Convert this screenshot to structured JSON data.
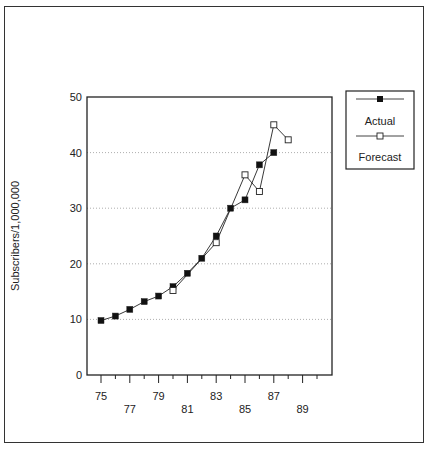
{
  "chart_data": {
    "type": "line",
    "title": "",
    "xlabel": "",
    "ylabel": "Subscribers/1,000,000",
    "ylim": [
      0,
      50
    ],
    "yticks": [
      0,
      10,
      20,
      30,
      40,
      50
    ],
    "xlim": [
      75,
      90
    ],
    "xtick_labels": [
      "75",
      "77",
      "79",
      "81",
      "83",
      "85",
      "87",
      "89"
    ],
    "grid": "horizontal dotted",
    "legend_position": "right",
    "series": [
      {
        "name": "Actual",
        "marker": "filled-square",
        "x": [
          75,
          76,
          77,
          78,
          79,
          80,
          81,
          82,
          83,
          84,
          85,
          86,
          87
        ],
        "values": [
          9.8,
          10.6,
          11.8,
          13.2,
          14.2,
          15.9,
          18.3,
          21.0,
          25.0,
          30.0,
          31.5,
          37.8,
          40.0
        ]
      },
      {
        "name": "Forecast",
        "marker": "open-square",
        "x": [
          80,
          83,
          85,
          86,
          87,
          88
        ],
        "values": [
          15.2,
          23.8,
          36.0,
          33.0,
          45.0,
          42.3
        ]
      }
    ]
  },
  "legend": {
    "actual_label": "Actual",
    "forecast_label": "Forecast"
  },
  "axis": {
    "ylabel": "Subscribers/1,000,000"
  }
}
